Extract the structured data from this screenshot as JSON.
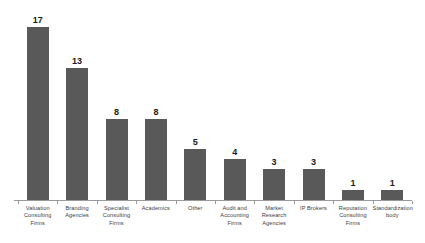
{
  "chart_data": {
    "type": "bar",
    "title": "",
    "subtitle": "",
    "xlabel": "",
    "ylabel": "",
    "ylim": [
      0,
      17
    ],
    "grid": false,
    "legend": false,
    "orientation": "vertical",
    "bar_color": "#595959",
    "background_color": "#ffffff",
    "axis_color": "#9a9a9a",
    "value_label_color": "#1a1a1a",
    "category_label_color": "#3d3d3d",
    "categories": [
      "Valuation Consulting Firms",
      "Branding Agencies",
      "Specialist Consulting Firms",
      "Academics",
      "Other",
      "Audit and Accounting Firms",
      "Market Research Agencies",
      "IP Brokers",
      "Reputation Consulting Firms",
      "Standardization body"
    ],
    "category_lines": [
      [
        "Valuation",
        "Consulting",
        "Firms"
      ],
      [
        "Branding",
        "Agencies"
      ],
      [
        "Specialist",
        "Consulting",
        "Firms"
      ],
      [
        "Academics"
      ],
      [
        "Other"
      ],
      [
        "Audit and",
        "Accounting",
        "Firms"
      ],
      [
        "Market",
        "Research",
        "Agencies"
      ],
      [
        "IP Brokers"
      ],
      [
        "Reputation",
        "Consulting",
        "Firms"
      ],
      [
        "Standardization",
        "body"
      ]
    ],
    "values": [
      17,
      13,
      8,
      8,
      5,
      4,
      3,
      3,
      1,
      1
    ],
    "value_labels": [
      "17",
      "13",
      "8",
      "8",
      "5",
      "4",
      "3",
      "3",
      "1",
      "1"
    ]
  }
}
